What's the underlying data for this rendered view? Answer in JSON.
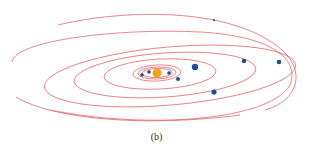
{
  "figure": {
    "caption": "(b)",
    "orbit_color": "#e0525a",
    "sun_color": "#f5a31a",
    "planet_color": "#1f4e9a"
  },
  "sun": {
    "cx": 157,
    "cy": 73,
    "r": 4.5
  },
  "orbits": [
    {
      "cx": 157,
      "cy": 73,
      "rx": 15,
      "ry": 4.5,
      "rot": -2
    },
    {
      "cx": 157,
      "cy": 73,
      "rx": 19,
      "ry": 6,
      "rot": -2
    },
    {
      "cx": 157,
      "cy": 73,
      "rx": 24,
      "ry": 8,
      "rot": -3
    },
    {
      "cx": 160,
      "cy": 74,
      "rx": 56,
      "ry": 15,
      "rot": -3
    },
    {
      "cx": 165,
      "cy": 75,
      "rx": 91,
      "ry": 22,
      "rot": -4
    },
    {
      "cx": 170,
      "cy": 76,
      "rx": 126,
      "ry": 29,
      "rot": -5
    }
  ],
  "arcs": [
    {
      "d": "M 58 25 C 120 10, 230 5, 282 50 C 305 70, 300 100, 265 110"
    },
    {
      "d": "M 12 62 C 15 40, 120 28, 200 32 C 270 36, 300 58, 290 85 C 270 120, 150 130, 50 110"
    },
    {
      "d": "M 16 97 C 50 118, 140 128, 240 115"
    }
  ],
  "planets": [
    {
      "name": "planet-1",
      "cx": 142,
      "cy": 75,
      "r": 1.8
    },
    {
      "name": "planet-2",
      "cx": 149,
      "cy": 72,
      "r": 1.8
    },
    {
      "name": "planet-3",
      "cx": 169,
      "cy": 73,
      "r": 1.8
    },
    {
      "name": "planet-4",
      "cx": 178,
      "cy": 79,
      "r": 2.0
    },
    {
      "name": "planet-5",
      "cx": 195,
      "cy": 67,
      "r": 3.2
    },
    {
      "name": "planet-6",
      "cx": 214,
      "cy": 92,
      "r": 2.6
    },
    {
      "name": "planet-7",
      "cx": 244,
      "cy": 61,
      "r": 2.3
    },
    {
      "name": "planet-8",
      "cx": 279,
      "cy": 62,
      "r": 2.3
    },
    {
      "name": "planet-9",
      "cx": 214,
      "cy": 20,
      "r": 1.1
    }
  ]
}
